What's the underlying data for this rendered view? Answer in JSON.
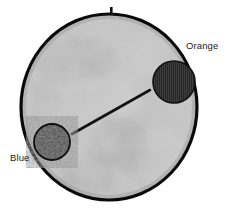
{
  "figure": {
    "type": "annotated-photograph",
    "canvas": {
      "width": 228,
      "height": 218,
      "background": "#ffffff"
    },
    "dish": {
      "name": "petri-dish",
      "center_x": 109,
      "center_y": 107,
      "radius_x": 89,
      "radius_y": 94,
      "outline_color": "#000000",
      "outline_width": 3.2,
      "fill_base_color": "#b4b4b4",
      "texture": "mottled-grayscale-agar"
    },
    "notch": {
      "name": "dish-top-notch",
      "x": 111,
      "y": 9,
      "width": 3,
      "height": 7,
      "color": "#111111"
    },
    "connector_line": {
      "name": "measurement-line",
      "x1": 72,
      "y1": 134,
      "x2": 150,
      "y2": 90,
      "color": "#111111",
      "width": 2.6
    },
    "markers": [
      {
        "id": "orange",
        "label": "Orange",
        "name": "colony-marker-orange",
        "cx": 174,
        "cy": 82,
        "r": 21,
        "fill": "#2b2b2b",
        "stroke": "#151515",
        "texture": "vertical-stripes",
        "label_position": "top-right"
      },
      {
        "id": "blue",
        "label": "Blue",
        "name": "colony-marker-blue",
        "cx": 52,
        "cy": 142,
        "r": 18,
        "fill": "#3a3a3a",
        "stroke": "#141414",
        "texture": "speckled",
        "label_position": "bottom-left"
      }
    ],
    "labels": {
      "orange": "Orange",
      "blue": "Blue"
    },
    "colors": {
      "ink": "#111111",
      "agar_light": "#c6c6c6",
      "agar_mid": "#b0b0b0",
      "agar_dark": "#9a9a9a",
      "agar_shadow": "#8c8c8c",
      "background": "#ffffff"
    }
  }
}
